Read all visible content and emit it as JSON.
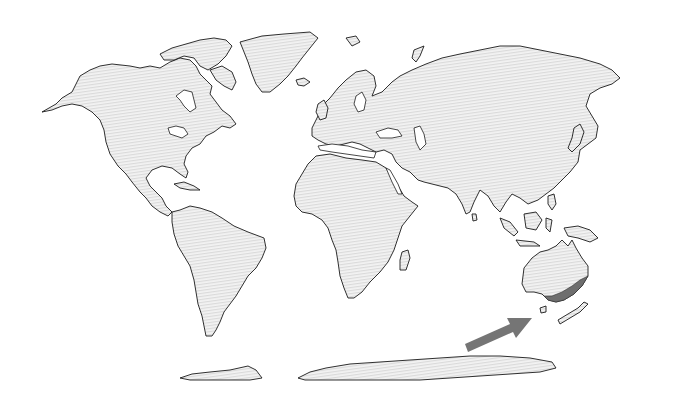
{
  "map": {
    "type": "world-map",
    "projection": "pseudocylindrical world projection",
    "land_fill": "light gray horizontal hatch",
    "colors": {
      "background": "#ffffff",
      "land_base": "#f2f2f2",
      "land_stripe": "#dcdcdc",
      "coastline": "#1a1a1a",
      "highlight": "#6e6e6e",
      "arrow": "#757575"
    },
    "highlighted_region": {
      "name": "Southeastern Australia",
      "description": "Coastal strip of south-east Australia shaded darker gray"
    },
    "annotation": {
      "type": "arrow",
      "direction": "pointing north-east toward highlighted region",
      "from": [
        465,
        348
      ],
      "to": [
        532,
        318
      ]
    },
    "landmasses": [
      "North America",
      "Greenland",
      "South America",
      "Europe",
      "Africa",
      "Asia",
      "Australia",
      "New Zealand",
      "Antarctica",
      "Madagascar",
      "Japan",
      "Indonesia",
      "Papua New Guinea"
    ]
  }
}
